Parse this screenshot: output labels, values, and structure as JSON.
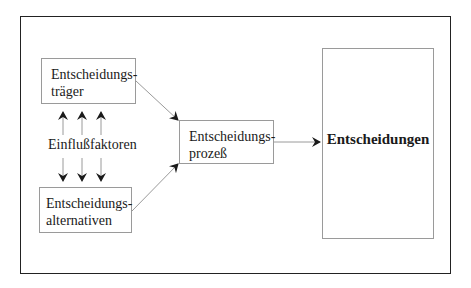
{
  "diagram": {
    "nodes": {
      "traeger": {
        "line1": "Entscheidungs-",
        "line2": "träger"
      },
      "alternativen": {
        "line1": "Entscheidungs-",
        "line2": "alternativen"
      },
      "prozess": {
        "line1": "Entscheidungs-",
        "line2": "prozeß"
      },
      "entscheidungen": {
        "label": "Entscheidungen"
      }
    },
    "influence_label": "Einflußfaktoren",
    "edges": [
      {
        "from": "Entscheidungsträger",
        "to": "Entscheidungsprozeß"
      },
      {
        "from": "Entscheidungsalternativen",
        "to": "Entscheidungsprozeß"
      },
      {
        "from": "Entscheidungsprozeß",
        "to": "Entscheidungen"
      },
      {
        "from": "Einflußfaktoren",
        "to": "Entscheidungsträger",
        "count": 3
      },
      {
        "from": "Einflußfaktoren",
        "to": "Entscheidungsalternativen",
        "count": 3
      }
    ],
    "colors": {
      "frame": "#222222",
      "box_border": "#9a9a9a",
      "arrow": "#9a9a9a",
      "arrowhead": "#1a1a1a"
    }
  }
}
